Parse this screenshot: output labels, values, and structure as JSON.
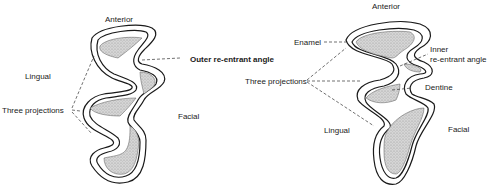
{
  "figure_left": {
    "labels": {
      "anterior": "Anterior",
      "outer_angle": "Outer re-entrant angle",
      "lingual": "Lingual",
      "three_projections": "Three projections",
      "facial": "Facial"
    }
  },
  "figure_right": {
    "labels": {
      "anterior": "Anterior",
      "enamel": "Enamel",
      "inner_angle_1": "Inner",
      "inner_angle_2": "re-entrant angle",
      "three_projections": "Three projections",
      "dentine": "Dentine",
      "lingual": "Lingual",
      "facial": "Facial"
    }
  },
  "colors": {
    "outline": "#1a1a1a",
    "dentine_fill": "#c9c9c9",
    "background": "#ffffff"
  }
}
